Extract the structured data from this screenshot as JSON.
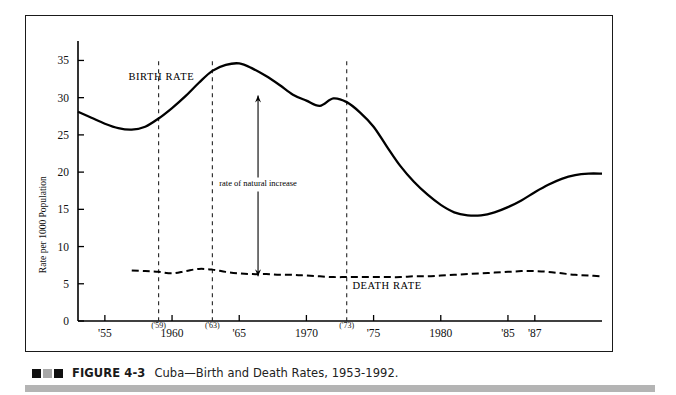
{
  "figure": {
    "caption_marker": [
      "black-square",
      "gray-square",
      "black-square"
    ],
    "number_label": "FIGURE 4-3",
    "caption_text": "Cuba—Birth and Death Rates, 1953-1992."
  },
  "chart_data": {
    "type": "line",
    "title": "",
    "xlabel": "",
    "ylabel": "Rate per 1000 Population",
    "xlim": [
      1953,
      1992
    ],
    "ylim": [
      0,
      36
    ],
    "yticks": [
      0,
      5,
      10,
      15,
      20,
      25,
      30,
      35
    ],
    "ytick_labels": [
      "0",
      "5",
      "10",
      "15",
      "20",
      "25",
      "30",
      "35"
    ],
    "grid": false,
    "legend_position": "inline-annotations",
    "xtick_years": [
      1955,
      1960,
      1965,
      1970,
      1975,
      1980,
      1985,
      1987
    ],
    "xtick_labels": [
      "'55",
      "1960",
      "'65",
      "1970",
      "'75",
      "1980",
      "'85",
      "'87"
    ],
    "x_secondary_labels": [
      {
        "year": 1959,
        "label": "('59)"
      },
      {
        "year": 1963,
        "label": "('63)"
      },
      {
        "year": 1973,
        "label": "('73)"
      }
    ],
    "reference_lines": [
      {
        "year": 1959,
        "style": "dashed"
      },
      {
        "year": 1963,
        "style": "dashed"
      },
      {
        "year": 1973,
        "style": "dashed"
      }
    ],
    "annotations": [
      {
        "name": "birth-rate-label",
        "text": "BIRTH RATE",
        "year": 1959.2,
        "value": 32.4
      },
      {
        "name": "death-rate-label",
        "text": "DEATH RATE",
        "year": 1976.0,
        "value": 4.3
      },
      {
        "name": "natural-increase-label",
        "text": "rate of natural increase",
        "year": 1966.4,
        "value": 18.2
      },
      {
        "name": "natural-increase-arrow",
        "text": "",
        "year": 1966.4,
        "value": 20.0,
        "arrow_from_value": 6.0,
        "arrow_to_value": 30.3
      }
    ],
    "series": [
      {
        "name": "BIRTH RATE",
        "style": "solid",
        "color": "#000000",
        "x": [
          1953,
          1954,
          1955,
          1956,
          1957,
          1958,
          1959,
          1960,
          1961,
          1962,
          1963,
          1964,
          1965,
          1966,
          1967,
          1968,
          1969,
          1970,
          1971,
          1972,
          1973,
          1974,
          1975,
          1976,
          1977,
          1978,
          1979,
          1980,
          1981,
          1982,
          1983,
          1984,
          1985,
          1986,
          1987,
          1988,
          1989,
          1990,
          1991,
          1992
        ],
        "values": [
          28.1,
          27.3,
          26.5,
          25.9,
          25.7,
          26.1,
          27.2,
          28.6,
          30.2,
          32.0,
          33.6,
          34.4,
          34.6,
          33.9,
          32.9,
          31.7,
          30.4,
          29.6,
          28.9,
          29.9,
          29.4,
          28.0,
          26.1,
          23.4,
          20.8,
          18.7,
          17.0,
          15.6,
          14.6,
          14.2,
          14.2,
          14.6,
          15.3,
          16.2,
          17.3,
          18.3,
          19.1,
          19.6,
          19.8,
          19.8
        ]
      },
      {
        "name": "DEATH RATE",
        "style": "dashed",
        "color": "#000000",
        "x": [
          1957,
          1958,
          1959,
          1960,
          1961,
          1962,
          1963,
          1964,
          1965,
          1966,
          1967,
          1968,
          1969,
          1970,
          1971,
          1972,
          1973,
          1974,
          1975,
          1976,
          1977,
          1978,
          1979,
          1980,
          1981,
          1982,
          1983,
          1984,
          1985,
          1986,
          1987,
          1988,
          1989,
          1990,
          1991,
          1992
        ],
        "values": [
          6.8,
          6.7,
          6.6,
          6.4,
          6.7,
          7.0,
          6.9,
          6.6,
          6.4,
          6.3,
          6.3,
          6.2,
          6.2,
          6.1,
          6.0,
          5.9,
          5.9,
          5.9,
          5.9,
          5.9,
          5.9,
          6.0,
          6.0,
          6.1,
          6.2,
          6.3,
          6.4,
          6.5,
          6.6,
          6.7,
          6.7,
          6.6,
          6.4,
          6.2,
          6.1,
          6.0
        ]
      }
    ]
  }
}
